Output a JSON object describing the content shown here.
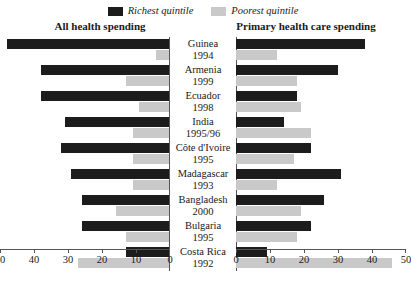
{
  "legend": {
    "entries": [
      {
        "label": "Richest quintile",
        "color": "#1c1c1c",
        "key": "rich"
      },
      {
        "label": "Poorest quintile",
        "color": "#c9c9c9",
        "key": "poor"
      }
    ]
  },
  "panels": {
    "left_title": "All health spending",
    "right_title": "Primary health care spending"
  },
  "chart_data": {
    "type": "bar",
    "orientation": "horizontal",
    "layout": "diverging-paired-panels",
    "title": "",
    "subtitle": "",
    "xlabel": "",
    "ylabel": "",
    "grid": false,
    "legend_position": "top-center",
    "panels": [
      {
        "name": "All health spending",
        "side": "left",
        "axis_reversed": true,
        "xlim": [
          0,
          50
        ],
        "ticks": [
          50,
          40,
          30,
          20,
          10,
          0
        ],
        "tick_labels": [
          "50",
          "40",
          "30",
          "20",
          "10",
          "0"
        ]
      },
      {
        "name": "Primary health care spending",
        "side": "right",
        "axis_reversed": false,
        "xlim": [
          0,
          50
        ],
        "ticks": [
          0,
          10,
          20,
          30,
          40,
          50
        ],
        "tick_labels": [
          "0",
          "10",
          "20",
          "30",
          "40",
          "50"
        ]
      }
    ],
    "categories": [
      "Guinea",
      "Armenia",
      "Ecuador",
      "India",
      "Côte d'Ivoire",
      "Madagascar",
      "Bangladesh",
      "Bulgaria",
      "Costa Rica"
    ],
    "category_years": [
      "1994",
      "1999",
      "1998",
      "1995/96",
      "1995",
      "1993",
      "2000",
      "1995",
      "1992"
    ],
    "series": [
      {
        "name": "Richest quintile",
        "panel": "All health spending",
        "color": "#1c1c1c",
        "values": [
          48,
          38,
          38,
          31,
          32,
          29,
          26,
          26,
          13
        ]
      },
      {
        "name": "Poorest quintile",
        "panel": "All health spending",
        "color": "#c9c9c9",
        "values": [
          4,
          13,
          9,
          11,
          11,
          11,
          16,
          13,
          27
        ]
      },
      {
        "name": "Richest quintile",
        "panel": "Primary health care spending",
        "color": "#1c1c1c",
        "values": [
          38,
          30,
          18,
          14,
          22,
          31,
          26,
          22,
          9
        ]
      },
      {
        "name": "Poorest quintile",
        "panel": "Primary health care spending",
        "color": "#c9c9c9",
        "values": [
          12,
          18,
          19,
          22,
          17,
          12,
          19,
          18,
          46
        ]
      }
    ]
  }
}
